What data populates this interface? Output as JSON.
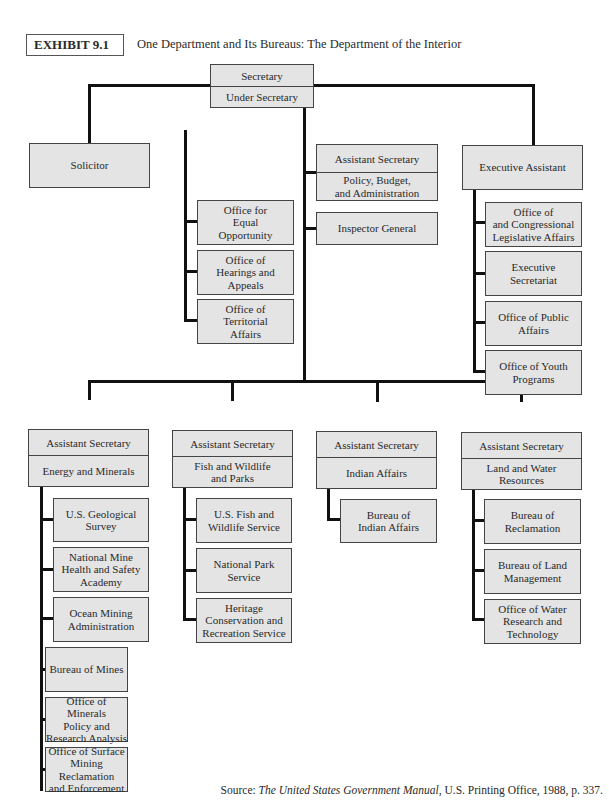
{
  "header": {
    "exhibit_label": "EXHIBIT 9.1",
    "title": "One Department and Its Bureaus: The Department of the Interior"
  },
  "top": {
    "secretary": "Secretary",
    "under_secretary": "Under Secretary"
  },
  "solicitor": "Solicitor",
  "asst_pba": {
    "title": "Assistant Secretary",
    "area": "Policy, Budget,\nand Administration"
  },
  "inspector_general": "Inspector General",
  "staff_offices": [
    "Office for\nEqual\nOpportunity",
    "Office of\nHearings and\nAppeals",
    "Office of\nTerritorial\nAffairs"
  ],
  "executive_assistant": {
    "title": "Executive Assistant",
    "offices": [
      "Office of\nand Congressional\nLegislative Affairs",
      "Executive\nSecretariat",
      "Office of Public\nAffairs",
      "Office of Youth\nPrograms"
    ]
  },
  "assistant_secretaries": [
    {
      "title": "Assistant Secretary",
      "area": "Energy and Minerals",
      "bureaus": [
        "U.S. Geological\nSurvey",
        "National Mine\nHealth and Safety\nAcademy",
        "Ocean Mining\nAdministration",
        "Bureau of Mines",
        "Office of Minerals\nPolicy and\nResearch Analysis",
        "Office of Surface\nMining Reclamation\nand Enforcement"
      ]
    },
    {
      "title": "Assistant Secretary",
      "area": "Fish and Wildlife\nand Parks",
      "bureaus": [
        "U.S. Fish and\nWildlife Service",
        "National Park\nService",
        "Heritage\nConservation and\nRecreation Service"
      ]
    },
    {
      "title": "Assistant Secretary",
      "area": "Indian Affairs",
      "bureaus": [
        "Bureau of\nIndian Affairs"
      ]
    },
    {
      "title": "Assistant Secretary",
      "area": "Land and Water\nResources",
      "bureaus": [
        "Bureau of\nReclamation",
        "Bureau of Land\nManagement",
        "Office of Water\nResearch and\nTechnology"
      ]
    }
  ],
  "source": {
    "prefix": "Source: ",
    "book": "The United States Government Manual",
    "suffix": ", U.S. Printing Office, 1988, p. 337."
  }
}
